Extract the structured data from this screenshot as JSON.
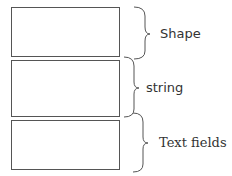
{
  "diagram": {
    "type": "stacked-record-layout",
    "segments": [
      {
        "label": "Shape",
        "top": 0,
        "height": 50
      },
      {
        "label": "string",
        "top": 53,
        "height": 57
      },
      {
        "label": "Text fields",
        "top": 113,
        "height": 50
      }
    ],
    "labels": {
      "shape": "Shape",
      "string": "string",
      "text_fields": "Text fields"
    },
    "colors": {
      "stroke": "#555555",
      "text": "#333333",
      "background": "#ffffff"
    }
  }
}
